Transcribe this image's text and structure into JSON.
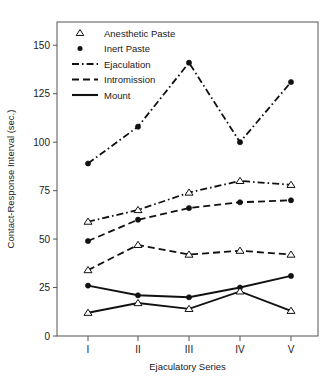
{
  "chart_data": {
    "type": "line",
    "title": "",
    "xlabel": "Ejaculatory Series",
    "ylabel": "Contact-Response Interval (sec.)",
    "categories": [
      "I",
      "II",
      "III",
      "IV",
      "V"
    ],
    "x_tick_labels": [
      "I",
      "II",
      "III",
      "IV",
      "V"
    ],
    "y_tick_labels": [
      "0",
      "25",
      "50",
      "75",
      "100",
      "125",
      "150"
    ],
    "y_ticks": [
      0,
      25,
      50,
      75,
      100,
      125,
      150
    ],
    "ylim": [
      0,
      162
    ],
    "grid": false,
    "legend_position": "top-left",
    "legend": [
      {
        "label": "Anesthetic Paste",
        "marker": "open-triangle",
        "line": "none"
      },
      {
        "label": "Inert Paste",
        "marker": "filled-circle",
        "line": "none"
      },
      {
        "label": "Ejaculation",
        "marker": "none",
        "line": "dash-dot"
      },
      {
        "label": "Intromission",
        "marker": "none",
        "line": "dashed"
      },
      {
        "label": "Mount",
        "marker": "none",
        "line": "solid"
      }
    ],
    "series": [
      {
        "name": "Ejaculation – Inert Paste",
        "behavior": "Ejaculation",
        "treatment": "Inert Paste",
        "marker": "filled-circle",
        "line": "dash-dot",
        "values": [
          89,
          108,
          141,
          100,
          131
        ]
      },
      {
        "name": "Ejaculation – Anesthetic Paste",
        "behavior": "Ejaculation",
        "treatment": "Anesthetic Paste",
        "marker": "open-triangle",
        "line": "dash-dot",
        "values": [
          59,
          65,
          74,
          80,
          78
        ]
      },
      {
        "name": "Intromission – Inert Paste",
        "behavior": "Intromission",
        "treatment": "Inert Paste",
        "marker": "filled-circle",
        "line": "dashed",
        "values": [
          49,
          60,
          66,
          69,
          70
        ]
      },
      {
        "name": "Intromission – Anesthetic Paste",
        "behavior": "Intromission",
        "treatment": "Anesthetic Paste",
        "marker": "open-triangle",
        "line": "dashed",
        "values": [
          34,
          47,
          42,
          44,
          42
        ]
      },
      {
        "name": "Mount – Inert Paste",
        "behavior": "Mount",
        "treatment": "Inert Paste",
        "marker": "filled-circle",
        "line": "solid",
        "values": [
          26,
          21,
          20,
          25,
          31
        ]
      },
      {
        "name": "Mount – Anesthetic Paste",
        "behavior": "Mount",
        "treatment": "Anesthetic Paste",
        "marker": "open-triangle",
        "line": "solid",
        "values": [
          12,
          17,
          14,
          23,
          13
        ]
      }
    ]
  },
  "colors": {
    "line": "#111111",
    "frame": "#555555",
    "text": "#1a1a1a",
    "background": "#ffffff"
  }
}
